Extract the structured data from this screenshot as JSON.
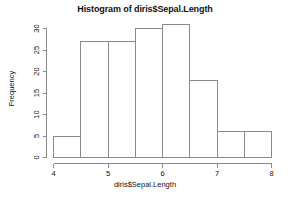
{
  "chart_data": {
    "type": "bar",
    "title": "Histogram of diris$Sepal.Length",
    "xlabel": "diris$Sepal.Length",
    "ylabel": "Frequency",
    "categories": [
      "4-4.5",
      "4.5-5",
      "5-5.5",
      "5.5-6",
      "6-6.5",
      "6.5-7",
      "7-7.5",
      "7.5-8"
    ],
    "bin_edges": [
      4,
      4.5,
      5,
      5.5,
      6,
      6.5,
      7,
      7.5,
      8
    ],
    "values": [
      5,
      27,
      27,
      30,
      31,
      18,
      6,
      6
    ],
    "xlim": [
      4,
      8
    ],
    "ylim": [
      0,
      31
    ],
    "xticks": [
      4,
      5,
      6,
      7,
      8
    ],
    "xtick_labels": [
      "4",
      "5",
      "6",
      "7",
      "8"
    ],
    "yticks": [
      0,
      5,
      10,
      15,
      20,
      25,
      30
    ],
    "ytick_labels": [
      "0",
      "5",
      "10",
      "15",
      "20",
      "25",
      "30"
    ],
    "grid": false,
    "legend": false,
    "bar_fill_color": "#ffffff",
    "bar_stroke_color": "#8b8b8b",
    "background_color": "#ffffff"
  }
}
